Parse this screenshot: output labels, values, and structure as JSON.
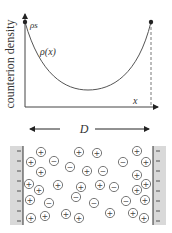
{
  "plot": {
    "ylabel": "counterion density",
    "xlabel": "x",
    "boundary_label": "ρs",
    "curve_label": "ρ(x)",
    "curve_color": "#555555"
  },
  "separation": {
    "label": "D"
  },
  "ions": {
    "positive_symbol": "+",
    "negative_symbol": "−",
    "wall_charge_symbol": "−",
    "positive": [
      [
        41,
        152
      ],
      [
        79,
        152
      ],
      [
        97,
        153
      ],
      [
        137,
        151
      ],
      [
        31,
        162
      ],
      [
        146,
        162
      ],
      [
        87,
        171
      ],
      [
        41,
        172
      ],
      [
        137,
        175
      ],
      [
        29,
        184
      ],
      [
        58,
        185
      ],
      [
        81,
        187
      ],
      [
        100,
        185
      ],
      [
        146,
        184
      ],
      [
        39,
        190
      ],
      [
        137,
        190
      ],
      [
        30,
        200
      ],
      [
        145,
        200
      ],
      [
        31,
        218
      ],
      [
        45,
        216
      ],
      [
        66,
        214
      ],
      [
        79,
        218
      ],
      [
        110,
        213
      ],
      [
        133,
        213
      ],
      [
        144,
        218
      ]
    ],
    "negative": [
      [
        54,
        161
      ],
      [
        123,
        162
      ],
      [
        70,
        167
      ],
      [
        103,
        171
      ],
      [
        114,
        187
      ],
      [
        76,
        197
      ],
      [
        94,
        203
      ],
      [
        49,
        203
      ],
      [
        126,
        201
      ]
    ]
  },
  "chart_data": {
    "type": "line",
    "title": "",
    "xlabel": "x",
    "ylabel": "counterion density",
    "series": [
      {
        "name": "ρ(x)",
        "shape": "U-shaped, symmetric, maxima ρs at both walls, minimum at x = D/2"
      }
    ],
    "annotations": [
      "ρs",
      "ρ(x)",
      "D"
    ]
  }
}
